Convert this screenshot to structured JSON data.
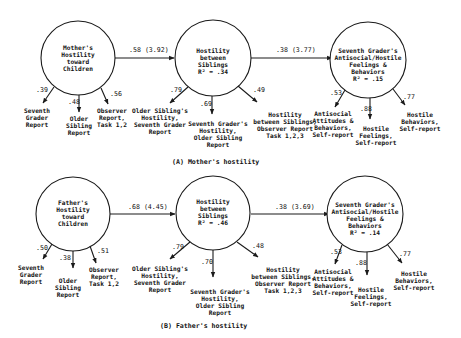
{
  "panels": [
    {
      "caption": "(A) Mother's hostility",
      "nodes": [
        {
          "lines": [
            "Mother's",
            "Hostility",
            "toward",
            "Children"
          ]
        },
        {
          "lines": [
            "Hostility",
            "between",
            "Siblings",
            "R² = .34"
          ]
        },
        {
          "lines": [
            "Seventh Grader's",
            "Antisocial/Hostile",
            "Feelings &",
            "Behaviors",
            "R² = .15"
          ]
        }
      ],
      "paths": [
        {
          "label": ".58 (3.92)"
        },
        {
          "label": ".38 (3.77)"
        }
      ],
      "indicators": [
        [
          {
            "loading": ".39",
            "lines": [
              "Seventh",
              "Grader",
              "Report"
            ]
          },
          {
            "loading": ".48",
            "lines": [
              "Older",
              "Sibling",
              "Report"
            ]
          },
          {
            "loading": ".56",
            "lines": [
              "Observer",
              "Report,",
              "Task 1,2"
            ]
          }
        ],
        [
          {
            "loading": ".79",
            "lines": [
              "Older Sibling's",
              "Hostility,",
              "Seventh Grader",
              "Report"
            ]
          },
          {
            "loading": ".69",
            "lines": [
              "Seventh Grader's",
              "Hostility,",
              "Older Sibling",
              "Report"
            ]
          },
          {
            "loading": ".49",
            "lines": [
              "Hostility",
              "between Siblings,",
              "Observer Report",
              "Task 1,2,3"
            ]
          }
        ],
        [
          {
            "loading": ".53",
            "lines": [
              "Antisocial",
              "Attitudes &",
              "Behaviors,",
              "Self-report"
            ]
          },
          {
            "loading": ".88",
            "lines": [
              "Hostile",
              "Feelings,",
              "Self-report"
            ]
          },
          {
            "loading": ".77",
            "lines": [
              "Hostile",
              "Behaviors,",
              "Self-report"
            ]
          }
        ]
      ]
    },
    {
      "caption": "(B) Father's hostility",
      "nodes": [
        {
          "lines": [
            "Father's",
            "Hostility",
            "toward",
            "Children"
          ]
        },
        {
          "lines": [
            "Hostility",
            "between",
            "Siblings",
            "R² = .46"
          ]
        },
        {
          "lines": [
            "Seventh Grader's",
            "Antisocial/Hostile",
            "Feelings &",
            "Behaviors",
            "R² = .14"
          ]
        }
      ],
      "paths": [
        {
          "label": ".68 (4.45)"
        },
        {
          "label": ".38 (3.69)"
        }
      ],
      "indicators": [
        [
          {
            "loading": ".50",
            "lines": [
              "Seventh",
              "Grader",
              "Report"
            ]
          },
          {
            "loading": ".38",
            "lines": [
              "Older",
              "Sibling",
              "Report"
            ]
          },
          {
            "loading": ".51",
            "lines": [
              "Observer",
              "Report,",
              "Task 1,2"
            ]
          }
        ],
        [
          {
            "loading": ".79",
            "lines": [
              "Older Sibling's",
              "Hostility,",
              "Seventh Grader",
              "Report"
            ]
          },
          {
            "loading": ".70",
            "lines": [
              "Seventh Grader's",
              "Hostility,",
              "Older Sibling",
              "Report"
            ]
          },
          {
            "loading": ".48",
            "lines": [
              "Hostility",
              "between Siblings,",
              "Observer Report",
              "Task 1,2,3"
            ]
          }
        ],
        [
          {
            "loading": ".53",
            "lines": [
              "Antisocial",
              "Attitudes &",
              "Behaviors,",
              "Self-report"
            ]
          },
          {
            "loading": ".88",
            "lines": [
              "Hostile",
              "Feelings,",
              "Self-report"
            ]
          },
          {
            "loading": ".77",
            "lines": [
              "Hostile",
              "Behaviors,",
              "Self-report"
            ]
          }
        ]
      ]
    }
  ]
}
